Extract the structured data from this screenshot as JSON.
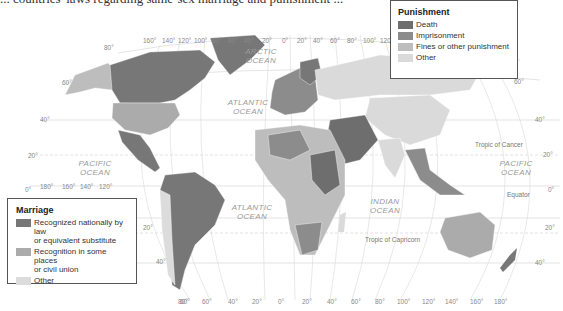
{
  "page_title_cut": "... countries' laws regarding same-sex marriage and punishment ...",
  "colors": {
    "death": "#6e6e6e",
    "imprisonment": "#8c8c8c",
    "fines": "#bdbdbd",
    "other": "#dadada",
    "marriage_recognized": "#777777",
    "marriage_some": "#ababab",
    "marriage_other": "#dcdcdc",
    "grid": "#cfcfcf"
  },
  "legend_punishment": {
    "title": "Punishment",
    "items": [
      {
        "label": "Death",
        "color": "#6e6e6e"
      },
      {
        "label": "Imprisonment",
        "color": "#8c8c8c"
      },
      {
        "label": "Fines or other punishment",
        "color": "#bdbdbd"
      },
      {
        "label": "Other",
        "color": "#dadada"
      }
    ]
  },
  "legend_marriage": {
    "title": "Marriage",
    "items": [
      {
        "label": "Recognized nationally by law or equivalent substitute",
        "line1": "Recognized nationally by law",
        "line2": "or equivalent substitute",
        "color": "#777777"
      },
      {
        "label": "Recognition in some places or civil union",
        "line1": "Recognition in some places",
        "line2": "or civil union",
        "color": "#ababab"
      },
      {
        "label": "Other",
        "line1": "Other",
        "line2": "",
        "color": "#dcdcdc"
      }
    ]
  },
  "oceans": {
    "arctic": [
      "ARCTIC",
      "OCEAN"
    ],
    "atlantic_north": [
      "ATLANTIC",
      "OCEAN"
    ],
    "atlantic_south": [
      "ATLANTIC",
      "OCEAN"
    ],
    "pacific_west": [
      "PACIFIC",
      "OCEAN"
    ],
    "pacific_east": [
      "PACIFIC",
      "OCEAN"
    ],
    "indian": [
      "INDIAN",
      "OCEAN"
    ]
  },
  "reference_lines": {
    "tropic_cancer": "Tropic of Cancer",
    "equator": "Equator",
    "tropic_capricorn": "Tropic of Capricorn"
  },
  "longitude_top": [
    "160°",
    "140°",
    "120°",
    "100°",
    "80°",
    "60°",
    "40°",
    "20°",
    "0°",
    "20°",
    "40°",
    "60°",
    "80°",
    "100°",
    "120°"
  ],
  "longitude_left": [
    "180°",
    "160°",
    "140°",
    "120°"
  ],
  "longitude_bottom": [
    "80°",
    "60°",
    "40°",
    "20°",
    "0°",
    "20°",
    "40°",
    "60°",
    "80°",
    "100°",
    "120°",
    "140°",
    "160°",
    "180°"
  ],
  "latitude_left": [
    "80°",
    "60°",
    "40°",
    "20°",
    "0°"
  ],
  "latitude_right": [
    "60°",
    "40°",
    "20°",
    "0°",
    "20°",
    "40°"
  ],
  "latitude_sa": [
    "20°",
    "40°",
    "60°"
  ]
}
